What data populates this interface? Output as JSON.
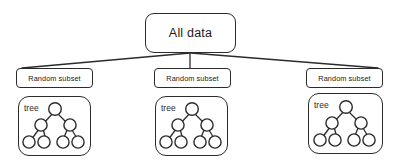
{
  "diagram": {
    "root": {
      "label": "All data",
      "shape": "rounded-rectangle"
    },
    "branches": [
      {
        "subset_label": "Random subset",
        "tree_label": "tree",
        "tree": {
          "levels": 3,
          "root_children": 2,
          "leaves_per_child": 2,
          "total_nodes": 7
        }
      },
      {
        "subset_label": "Random subset",
        "tree_label": "tree",
        "tree": {
          "levels": 3,
          "root_children": 2,
          "leaves_per_child": 2,
          "total_nodes": 7
        }
      },
      {
        "subset_label": "Random subset",
        "tree_label": "tree",
        "tree": {
          "levels": 3,
          "root_children": 2,
          "leaves_per_child": 2,
          "total_nodes": 7
        }
      }
    ],
    "colors": {
      "background": "#ffffff",
      "stroke": "#2b2b2b",
      "text": "#1a1a1a",
      "node_fill": "#ffffff"
    }
  }
}
